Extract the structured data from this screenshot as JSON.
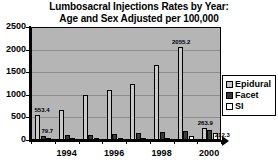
{
  "chart_data": {
    "type": "bar",
    "title": "Lumbosacral Injections Rates by Year:",
    "subtitle": "Age and Sex Adjusted per 100,000",
    "xlabel": "",
    "ylabel": "",
    "ylim": [
      0,
      2500
    ],
    "yticks": [
      0,
      500,
      1000,
      1500,
      2000,
      2500
    ],
    "ytick_labels": [
      "0",
      "500",
      "1000",
      "1500",
      "2000",
      "2500"
    ],
    "grid": true,
    "legend_position": "right",
    "categories": [
      "1993",
      "1994",
      "1995",
      "1996",
      "1997",
      "1998",
      "1999",
      "2000"
    ],
    "xtick_labels": [
      "1994",
      "1996",
      "1998",
      "2000"
    ],
    "series": [
      {
        "name": "Epidural",
        "color": "#c9c9c9",
        "values": [
          553.4,
          670,
          985,
          1100,
          1230,
          1660,
          2055.2,
          263.9
        ]
      },
      {
        "name": "Facet",
        "color": "#3a3a3a",
        "values": [
          79.7,
          105,
          120,
          140,
          150,
          175,
          200,
          212.3
        ]
      },
      {
        "name": "SI",
        "color": "#ffffff",
        "values": [
          10,
          12,
          15,
          20,
          25,
          40,
          95,
          150
        ]
      }
    ],
    "annotations": [
      {
        "text": "553.4",
        "series": "Epidural",
        "category": "1993"
      },
      {
        "text": "79.7",
        "series": "Facet",
        "category": "1993"
      },
      {
        "text": "2055.2",
        "series": "Epidural",
        "category": "1999"
      },
      {
        "text": "263.9",
        "series": "Epidural",
        "category": "2000"
      },
      {
        "text": "212.3",
        "series": "Facet",
        "category": "2000"
      }
    ]
  },
  "legend": {
    "items": [
      {
        "label": "Epidural",
        "swatch": "epidural"
      },
      {
        "label": "Facet",
        "swatch": "facet"
      },
      {
        "label": "SI",
        "swatch": "si"
      }
    ]
  }
}
